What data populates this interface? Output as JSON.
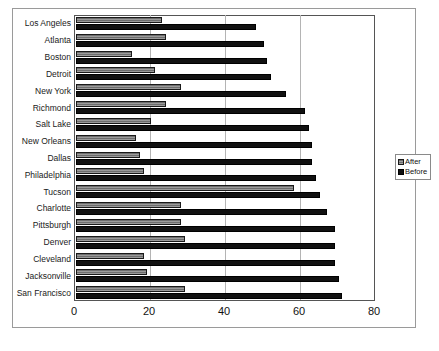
{
  "chart_data": {
    "type": "bar",
    "orientation": "horizontal",
    "title": "",
    "xlabel": "",
    "ylabel": "",
    "xlim": [
      0,
      80
    ],
    "xticks": [
      0,
      20,
      40,
      60,
      80
    ],
    "gridlines": [
      20,
      40,
      60
    ],
    "grid": true,
    "legend_position": "right",
    "categories": [
      "Los Angeles",
      "Atlanta",
      "Boston",
      "Detroit",
      "New York",
      "Richmond",
      "Salt Lake",
      "New Orleans",
      "Dallas",
      "Philadelphia",
      "Tucson",
      "Charlotte",
      "Pittsburgh",
      "Denver",
      "Cleveland",
      "Jacksonville",
      "San Francisco"
    ],
    "series": [
      {
        "name": "After",
        "color": "#6e6e6e",
        "values": [
          23,
          24,
          15,
          21,
          28,
          24,
          20,
          16,
          17,
          18,
          58,
          28,
          28,
          29,
          18,
          19,
          29
        ]
      },
      {
        "name": "Before",
        "color": "#111111",
        "values": [
          48,
          50,
          51,
          52,
          56,
          61,
          62,
          63,
          63,
          64,
          65,
          67,
          69,
          69,
          69,
          70,
          71
        ]
      }
    ]
  },
  "legend": {
    "entries": [
      {
        "label": "After",
        "swatch": "after"
      },
      {
        "label": "Before",
        "swatch": "before"
      }
    ]
  }
}
